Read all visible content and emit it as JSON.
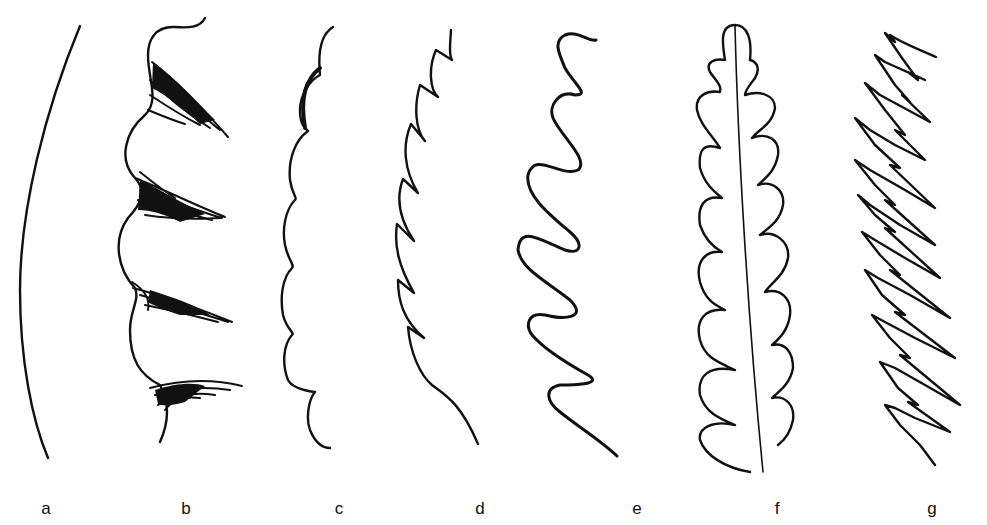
{
  "figure": {
    "panels": [
      {
        "id": "a",
        "label": "a",
        "type": "entire"
      },
      {
        "id": "b",
        "label": "b",
        "type": "ciliate"
      },
      {
        "id": "c",
        "label": "c",
        "type": "crenate"
      },
      {
        "id": "d",
        "label": "d",
        "type": "serrate"
      },
      {
        "id": "e",
        "label": "e",
        "type": "sinuate"
      },
      {
        "id": "f",
        "label": "f",
        "type": "lobed"
      },
      {
        "id": "g",
        "label": "g",
        "type": "doubly-serrate"
      }
    ],
    "ink_color": "#111111",
    "background": "#ffffff"
  }
}
